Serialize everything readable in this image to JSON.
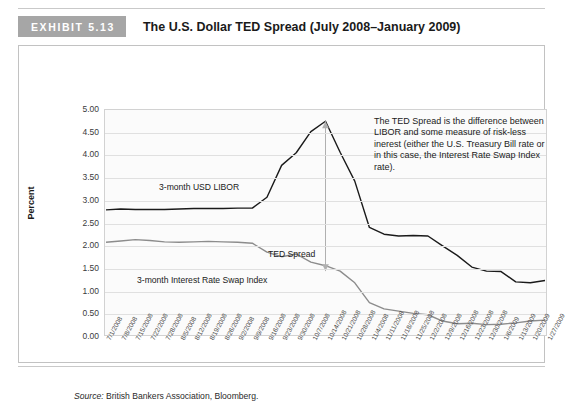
{
  "header": {
    "badge": "EXHIBIT 5.13",
    "title": "The U.S. Dollar TED Spread (July 2008–January 2009)"
  },
  "source": {
    "prefix": "Source:",
    "text": " British Bankers Association, Bloomberg."
  },
  "annotations": {
    "note": "The TED Spread is the difference between LIBOR and some measure of risk-less inerest (either the U.S. Treasury Bill rate or in this case, the Interest Rate Swap Index rate).",
    "libor_label": "3-month USD LIBOR",
    "ted_label": "TED Spread",
    "swap_label": "3-month Interest Rate Swap Index"
  },
  "colors": {
    "libor": "#1a1a1a",
    "swap": "#8c8c8c",
    "arrow": "#b0b0b0",
    "grid": "#e0e0e0",
    "badge": "#a6a6a6",
    "plot_bg": "#fbfbfb"
  },
  "chart_data": {
    "type": "line",
    "title": "The U.S. Dollar TED Spread (July 2008–January 2009)",
    "xlabel": "",
    "ylabel": "Percent",
    "ylim": [
      0.0,
      5.0
    ],
    "ytick_labels": [
      "5.00",
      "4.50",
      "4.00",
      "3.50",
      "3.00",
      "2.50",
      "2.00",
      "1.50",
      "1.00",
      "0.50",
      "0.00"
    ],
    "ytick_values": [
      5.0,
      4.5,
      4.0,
      3.5,
      3.0,
      2.5,
      2.0,
      1.5,
      1.0,
      0.5,
      0.0
    ],
    "grid": "horizontal",
    "legend": "inline-labels",
    "categories": [
      "7/1/2008",
      "7/8/2008",
      "7/15/2008",
      "7/22/2008",
      "7/28/2008",
      "8/5/2008",
      "8/12/2008",
      "8/19/2008",
      "8/26/2008",
      "9/2/2008",
      "9/9/2008",
      "9/16/2008",
      "9/23/2008",
      "9/30/2008",
      "10/7/2008",
      "10/14/2008",
      "10/21/2008",
      "10/28/2008",
      "11/4/2008",
      "11/11/2008",
      "11/18/2008",
      "11/25/2008",
      "12/2/2008",
      "12/9/2008",
      "12/16/2008",
      "12/23/2008",
      "12/30/2008",
      "1/6/2009",
      "1/13/2009",
      "1/20/2009",
      "1/27/2009"
    ],
    "series": [
      {
        "name": "3-month USD LIBOR",
        "color": "#1a1a1a",
        "values": [
          2.78,
          2.8,
          2.79,
          2.79,
          2.79,
          2.8,
          2.81,
          2.81,
          2.81,
          2.82,
          2.82,
          3.06,
          3.77,
          4.05,
          4.52,
          4.75,
          4.06,
          3.42,
          2.39,
          2.24,
          2.2,
          2.21,
          2.2,
          1.98,
          1.77,
          1.51,
          1.42,
          1.41,
          1.18,
          1.16,
          1.21
        ]
      },
      {
        "name": "3-month Interest Rate Swap Index",
        "color": "#8c8c8c",
        "values": [
          2.06,
          2.09,
          2.12,
          2.1,
          2.07,
          2.06,
          2.07,
          2.08,
          2.07,
          2.06,
          2.04,
          1.84,
          1.74,
          1.8,
          1.62,
          1.54,
          1.42,
          1.16,
          0.72,
          0.58,
          0.53,
          0.48,
          0.45,
          0.31,
          0.25,
          0.26,
          0.23,
          0.24,
          0.27,
          0.31,
          0.33
        ]
      }
    ],
    "spread_marker": {
      "label": "TED Spread",
      "at_category": "10/14/2008",
      "top_value": 4.75,
      "bottom_value": 1.42
    }
  }
}
